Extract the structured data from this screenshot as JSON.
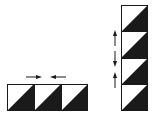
{
  "colors": {
    "fill": "#1a1a1a",
    "stroke": "#1a1a1a",
    "background": "#ffffff"
  },
  "horizontal_row": {
    "tile_count": 3,
    "tiles": [
      {
        "x": 7,
        "y": 84,
        "size": 27,
        "pattern": "half-square-triangle"
      },
      {
        "x": 34,
        "y": 84,
        "size": 27,
        "pattern": "half-square-triangle"
      },
      {
        "x": 61,
        "y": 84,
        "size": 27,
        "pattern": "half-square-triangle"
      }
    ],
    "arrows": [
      {
        "direction": "right",
        "x1": 26,
        "x2": 42,
        "y": 77
      },
      {
        "direction": "left",
        "x1": 50,
        "x2": 66,
        "y": 77
      }
    ]
  },
  "vertical_column": {
    "tile_count": 4,
    "tiles": [
      {
        "x": 121,
        "y": 5,
        "size": 26.5,
        "pattern": "half-square-triangle"
      },
      {
        "x": 121,
        "y": 31.5,
        "size": 26.5,
        "pattern": "half-square-triangle"
      },
      {
        "x": 121,
        "y": 58,
        "size": 26.5,
        "pattern": "half-square-triangle"
      },
      {
        "x": 121,
        "y": 84.5,
        "size": 26.5,
        "pattern": "half-square-triangle"
      }
    ],
    "arrows": [
      {
        "direction": "up",
        "x": 115,
        "y1": 45,
        "y2": 30
      },
      {
        "direction": "down",
        "x": 115,
        "y1": 52,
        "y2": 66
      },
      {
        "direction": "up",
        "x": 115,
        "y1": 88,
        "y2": 72
      }
    ]
  }
}
